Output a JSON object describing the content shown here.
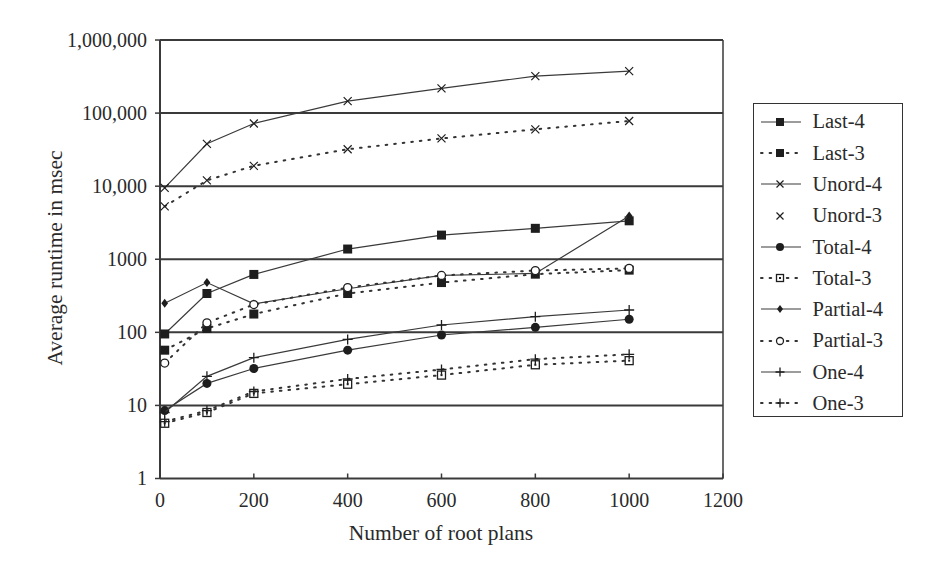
{
  "chart_data": {
    "type": "line",
    "title": "",
    "xlabel": "Number of root plans",
    "ylabel": "Average runtime in msec",
    "xscale": "linear",
    "yscale": "log",
    "xlim": [
      0,
      1200
    ],
    "ylim": [
      1,
      1000000
    ],
    "x_ticks": [
      0,
      200,
      400,
      600,
      800,
      1000,
      1200
    ],
    "x_tick_labels": [
      "0",
      "200",
      "400",
      "600",
      "800",
      "1000",
      "1200"
    ],
    "y_ticks": [
      1,
      10,
      100,
      1000,
      10000,
      100000,
      1000000
    ],
    "y_tick_labels": [
      "1",
      "10",
      "100",
      "1000",
      "10,000",
      "100,000",
      "1,000,000"
    ],
    "grid": "horizontal lines at each decade",
    "legend_position": "right",
    "x": [
      10,
      100,
      200,
      400,
      600,
      800,
      1000
    ],
    "series": [
      {
        "name": "Last-4",
        "line": "solid",
        "marker": "filled-square",
        "legend_line": true,
        "values": [
          95,
          340,
          620,
          1380,
          2140,
          2650,
          3360
        ]
      },
      {
        "name": "Last-3",
        "line": "dotted",
        "marker": "filled-square",
        "legend_line": true,
        "values": [
          57,
          113,
          178,
          340,
          480,
          625,
          710
        ]
      },
      {
        "name": "Unord-4",
        "line": "solid",
        "marker": "x",
        "legend_line": true,
        "values": [
          9500,
          38000,
          72000,
          146000,
          218000,
          320000,
          375000
        ]
      },
      {
        "name": "Unord-3",
        "line": "dotted",
        "marker": "x",
        "legend_line": false,
        "values": [
          5300,
          12000,
          19000,
          32000,
          45000,
          60000,
          78000
        ]
      },
      {
        "name": "Total-4",
        "line": "solid",
        "marker": "filled-circle",
        "legend_line": true,
        "values": [
          8.5,
          20,
          32,
          57,
          92,
          117,
          151
        ]
      },
      {
        "name": "Total-3",
        "line": "dotted",
        "marker": "open-square",
        "legend_line": true,
        "values": [
          5.7,
          8,
          14.6,
          19.5,
          26,
          36,
          41
        ]
      },
      {
        "name": "Partial-4",
        "line": "solid",
        "marker": "filled-diamond",
        "legend_line": true,
        "values": [
          250,
          480,
          245,
          395,
          600,
          640,
          3900
        ]
      },
      {
        "name": "Partial-3",
        "line": "dotted",
        "marker": "open-circle",
        "legend_line": true,
        "values": [
          38,
          135,
          240,
          410,
          600,
          700,
          750
        ]
      },
      {
        "name": "One-4",
        "line": "solid",
        "marker": "plus",
        "legend_line": true,
        "values": [
          8,
          25,
          45,
          80,
          126,
          164,
          202
        ]
      },
      {
        "name": "One-3",
        "line": "dotted",
        "marker": "plus",
        "legend_line": true,
        "values": [
          6,
          8.5,
          15.5,
          23,
          31,
          43,
          50
        ]
      }
    ]
  },
  "colors": {
    "background": "#ffffff",
    "ink": "#2a2a2a",
    "grid": "#3a3a3a"
  }
}
